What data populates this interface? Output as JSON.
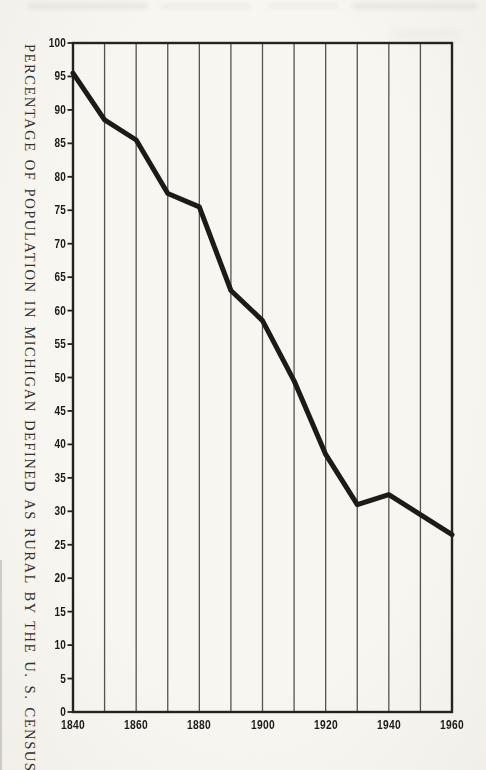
{
  "chart_data": {
    "type": "line",
    "title": "",
    "xlabel": "",
    "ylabel": "PERCENTAGE OF POPULATION IN MICHIGAN DEFINED AS RURAL BY THE U. S. CENSUS",
    "x": [
      1840,
      1850,
      1860,
      1870,
      1880,
      1890,
      1900,
      1910,
      1920,
      1930,
      1940,
      1950,
      1960
    ],
    "series": [
      {
        "name": "percent-of-michigan-population-rural",
        "values": [
          95.5,
          88.5,
          85.5,
          77.5,
          75.5,
          63,
          58.5,
          49.5,
          38.5,
          31,
          32.5,
          29.5,
          26.5
        ]
      }
    ],
    "xlim": [
      1840,
      1960
    ],
    "ylim": [
      0,
      100
    ],
    "y_tick_interval": 5,
    "y_tick_labels": [
      "100",
      "95",
      "90",
      "85",
      "80",
      "75",
      "70",
      "65",
      "60",
      "55",
      "50",
      "45",
      "40",
      "35",
      "30",
      "25",
      "20",
      "15",
      "10",
      "5",
      "0"
    ],
    "x_gridline_interval": 10,
    "x_tick_labels": [
      "1840",
      "1860",
      "1880",
      "1900",
      "1920",
      "1940",
      "1960"
    ],
    "grid": "vertical-only",
    "legend": "none",
    "colors": {
      "line": "#1d1b18",
      "grid": "#57534c",
      "frame": "#26231e",
      "ink": "#1d1b18",
      "paper": "#f5f3ee"
    }
  }
}
